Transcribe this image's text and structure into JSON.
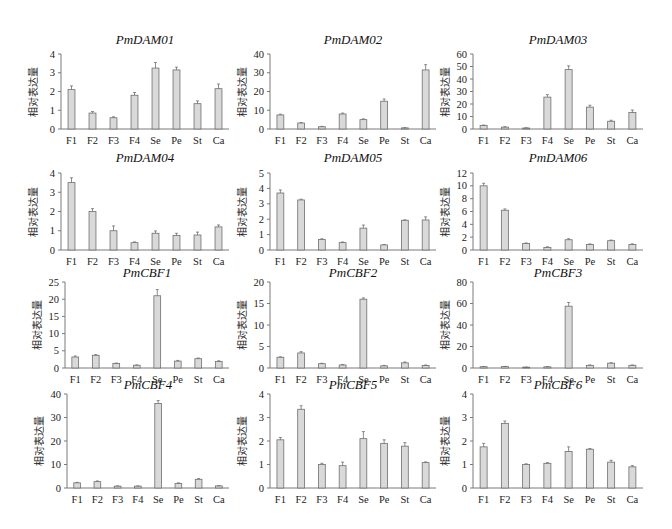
{
  "figure": {
    "ylabel": "相对表达量",
    "categories": [
      "F1",
      "F2",
      "F3",
      "F4",
      "Se",
      "Pe",
      "St",
      "Ca"
    ]
  },
  "chart_data": [
    {
      "type": "bar",
      "title": "PmDAM01",
      "ylabel": "相对表达量",
      "categories": [
        "F1",
        "F2",
        "F3",
        "F4",
        "Se",
        "Pe",
        "St",
        "Ca"
      ],
      "values": [
        2.1,
        0.85,
        0.6,
        1.8,
        3.25,
        3.15,
        1.35,
        2.15
      ],
      "errors": [
        0.2,
        0.08,
        0.05,
        0.15,
        0.3,
        0.15,
        0.15,
        0.25
      ],
      "ylim": [
        0,
        4
      ],
      "yticks": [
        0,
        1,
        2,
        3,
        4
      ],
      "grid": false
    },
    {
      "type": "bar",
      "title": "PmDAM02",
      "ylabel": "相对表达量",
      "categories": [
        "F1",
        "F2",
        "F3",
        "F4",
        "Se",
        "Pe",
        "St",
        "Ca"
      ],
      "values": [
        7.5,
        3.2,
        1.2,
        8.0,
        5.0,
        14.8,
        0.6,
        31.5
      ],
      "errors": [
        0.4,
        0.3,
        0.2,
        0.5,
        0.4,
        1.2,
        0.1,
        2.8
      ],
      "ylim": [
        0,
        40
      ],
      "yticks": [
        0,
        10,
        20,
        30,
        40
      ],
      "grid": false
    },
    {
      "type": "bar",
      "title": "PmDAM03",
      "ylabel": "相对表达量",
      "categories": [
        "F1",
        "F2",
        "F3",
        "F4",
        "Se",
        "Pe",
        "St",
        "Ca"
      ],
      "values": [
        2.8,
        1.5,
        0.8,
        25.5,
        47.5,
        17.5,
        6.2,
        13.2
      ],
      "errors": [
        0.4,
        0.3,
        0.2,
        2.0,
        3.0,
        1.5,
        0.8,
        2.0
      ],
      "ylim": [
        0,
        60
      ],
      "yticks": [
        0,
        10,
        20,
        30,
        40,
        50,
        60
      ],
      "grid": false
    },
    {
      "type": "bar",
      "title": "PmDAM04",
      "ylabel": "相对表达量",
      "categories": [
        "F1",
        "F2",
        "F3",
        "F4",
        "Se",
        "Pe",
        "St",
        "Ca"
      ],
      "values": [
        3.5,
        2.0,
        1.0,
        0.38,
        0.87,
        0.75,
        0.78,
        1.2
      ],
      "errors": [
        0.25,
        0.15,
        0.25,
        0.04,
        0.12,
        0.12,
        0.15,
        0.1
      ],
      "ylim": [
        0,
        4
      ],
      "yticks": [
        0,
        1,
        2,
        3,
        4
      ],
      "grid": false
    },
    {
      "type": "bar",
      "title": "PmDAM05",
      "ylabel": "相对表达量",
      "categories": [
        "F1",
        "F2",
        "F3",
        "F4",
        "Se",
        "Pe",
        "St",
        "Ca"
      ],
      "values": [
        3.7,
        3.25,
        0.68,
        0.48,
        1.42,
        0.33,
        1.93,
        1.95
      ],
      "errors": [
        0.2,
        0.05,
        0.05,
        0.04,
        0.2,
        0.03,
        0.03,
        0.2
      ],
      "ylim": [
        0,
        5
      ],
      "yticks": [
        0,
        1,
        2,
        3,
        4,
        5
      ],
      "grid": false
    },
    {
      "type": "bar",
      "title": "PmDAM06",
      "ylabel": "相对表达量",
      "categories": [
        "F1",
        "F2",
        "F3",
        "F4",
        "Se",
        "Pe",
        "St",
        "Ca"
      ],
      "values": [
        10.0,
        6.2,
        1.0,
        0.4,
        1.6,
        0.85,
        1.45,
        0.85
      ],
      "errors": [
        0.4,
        0.2,
        0.1,
        0.1,
        0.15,
        0.1,
        0.1,
        0.1
      ],
      "ylim": [
        0,
        12
      ],
      "yticks": [
        0,
        2,
        4,
        6,
        8,
        10,
        12
      ],
      "grid": false
    },
    {
      "type": "bar",
      "title": "PmCBF1",
      "ylabel": "相对表达量",
      "categories": [
        "F1",
        "F2",
        "F3",
        "F4",
        "Se",
        "Pe",
        "St",
        "Ca"
      ],
      "values": [
        3.2,
        3.7,
        1.3,
        0.8,
        21.0,
        2.0,
        2.7,
        1.9
      ],
      "errors": [
        0.3,
        0.2,
        0.15,
        0.1,
        1.8,
        0.2,
        0.2,
        0.2
      ],
      "ylim": [
        0,
        25
      ],
      "yticks": [
        0,
        5,
        10,
        15,
        20,
        25
      ],
      "grid": false
    },
    {
      "type": "bar",
      "title": "PmCBF2",
      "ylabel": "相对表达量",
      "categories": [
        "F1",
        "F2",
        "F3",
        "F4",
        "Se",
        "Pe",
        "St",
        "Ca"
      ],
      "values": [
        2.5,
        3.5,
        1.0,
        0.7,
        16.0,
        0.5,
        1.2,
        0.6
      ],
      "errors": [
        0.1,
        0.3,
        0.1,
        0.1,
        0.3,
        0.1,
        0.2,
        0.1
      ],
      "ylim": [
        0,
        20
      ],
      "yticks": [
        0,
        5,
        10,
        15,
        20
      ],
      "grid": false
    },
    {
      "type": "bar",
      "title": "PmCBF3",
      "ylabel": "相对表达量",
      "categories": [
        "F1",
        "F2",
        "F3",
        "F4",
        "Se",
        "Pe",
        "St",
        "Ca"
      ],
      "values": [
        1.2,
        1.3,
        0.8,
        1.1,
        57.5,
        2.5,
        4.5,
        2.5
      ],
      "errors": [
        0.2,
        0.2,
        0.1,
        0.2,
        3.5,
        0.3,
        0.4,
        0.3
      ],
      "ylim": [
        0,
        80
      ],
      "yticks": [
        0,
        20,
        40,
        60,
        80
      ],
      "grid": false
    },
    {
      "type": "bar",
      "title": "PmCBF4",
      "ylabel": "相对表达量",
      "categories": [
        "F1",
        "F2",
        "F3",
        "F4",
        "Se",
        "Pe",
        "St",
        "Ca"
      ],
      "values": [
        2.2,
        2.7,
        0.8,
        0.8,
        36.0,
        1.9,
        3.7,
        0.9
      ],
      "errors": [
        0.2,
        0.3,
        0.1,
        0.1,
        1.2,
        0.3,
        0.3,
        0.1
      ],
      "ylim": [
        0,
        40
      ],
      "yticks": [
        0,
        10,
        20,
        30,
        40
      ],
      "grid": false
    },
    {
      "type": "bar",
      "title": "PmCBF5",
      "ylabel": "相对表达量",
      "categories": [
        "F1",
        "F2",
        "F3",
        "F4",
        "Se",
        "Pe",
        "St",
        "Ca"
      ],
      "values": [
        2.05,
        3.35,
        1.0,
        0.95,
        2.1,
        1.9,
        1.78,
        1.08
      ],
      "errors": [
        0.1,
        0.15,
        0.05,
        0.15,
        0.3,
        0.15,
        0.15,
        0.03
      ],
      "ylim": [
        0,
        4
      ],
      "yticks": [
        0,
        1,
        2,
        3,
        4
      ],
      "grid": false
    },
    {
      "type": "bar",
      "title": "PmCBF6",
      "ylabel": "相对表达量",
      "categories": [
        "F1",
        "F2",
        "F3",
        "F4",
        "Se",
        "Pe",
        "St",
        "Ca"
      ],
      "values": [
        1.75,
        2.75,
        1.0,
        1.05,
        1.55,
        1.65,
        1.1,
        0.9
      ],
      "errors": [
        0.15,
        0.1,
        0.03,
        0.03,
        0.2,
        0.03,
        0.08,
        0.05
      ],
      "ylim": [
        0,
        4
      ],
      "yticks": [
        0,
        1,
        2,
        3,
        4
      ],
      "grid": false
    }
  ]
}
